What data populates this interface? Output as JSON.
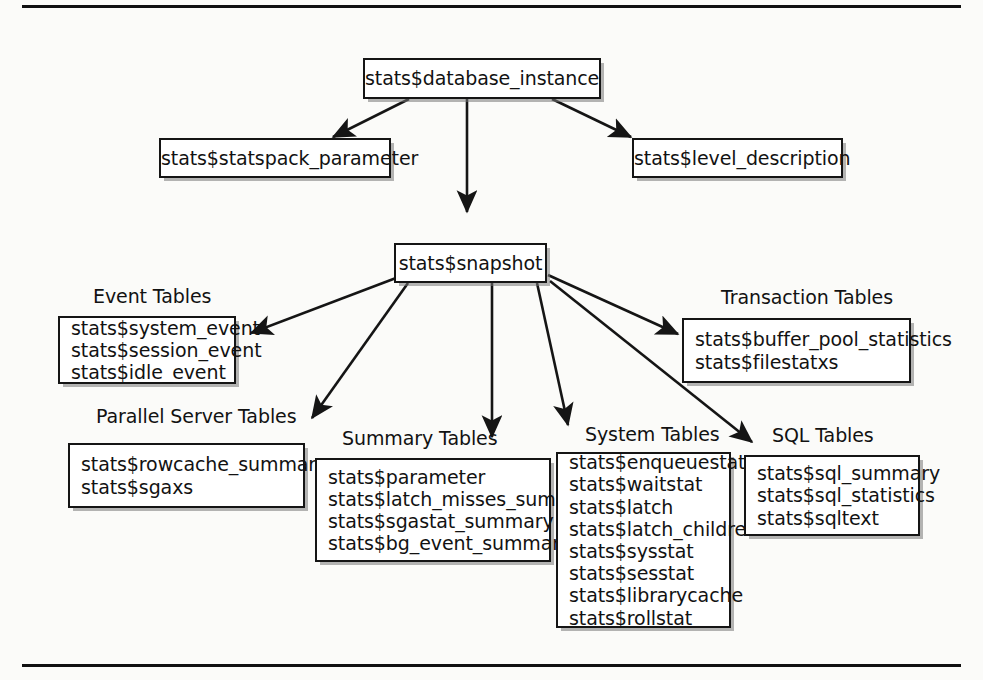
{
  "diagram": {
    "background_color": "#fbfbf9",
    "line_color": "#151515",
    "box_fill": "#ffffff",
    "rules": {
      "top": "horizontal-rule",
      "bottom": "horizontal-rule"
    }
  },
  "nodes": {
    "database_instance": {
      "label": "stats$database_instance"
    },
    "statspack_parameter": {
      "label": "stats$statspack_parameter"
    },
    "level_description": {
      "label": "stats$level_description"
    },
    "snapshot": {
      "label": "stats$snapshot"
    },
    "event_tables": {
      "group_label": "Event Tables",
      "lines": [
        "stats$system_event",
        "stats$session_event",
        "stats$idle_event"
      ]
    },
    "transaction_tables": {
      "group_label": "Transaction Tables",
      "lines": [
        "stats$buffer_pool_statistics",
        "stats$filestatxs"
      ]
    },
    "parallel_server_tables": {
      "group_label": "Parallel Server Tables",
      "lines": [
        "stats$rowcache_summary",
        "stats$sgaxs"
      ]
    },
    "summary_tables": {
      "group_label": "Summary Tables",
      "lines": [
        "stats$parameter",
        "stats$latch_misses_summary",
        "stats$sgastat_summary",
        "stats$bg_event_summary"
      ]
    },
    "system_tables": {
      "group_label": "System Tables",
      "lines": [
        "stats$enqueuestat",
        "stats$waitstat",
        "stats$latch",
        "stats$latch_children",
        "stats$sysstat",
        "stats$sesstat",
        "stats$librarycache",
        "stats$rollstat"
      ]
    },
    "sql_tables": {
      "group_label": "SQL Tables",
      "lines": [
        "stats$sql_summary",
        "stats$sql_statistics",
        "stats$sqltext"
      ]
    }
  },
  "edges": [
    {
      "from": "stats$database_instance",
      "to": "stats$statspack_parameter"
    },
    {
      "from": "stats$database_instance",
      "to": "stats$snapshot"
    },
    {
      "from": "stats$database_instance",
      "to": "stats$level_description"
    },
    {
      "from": "stats$snapshot",
      "to": "Event Tables"
    },
    {
      "from": "stats$snapshot",
      "to": "Parallel Server Tables"
    },
    {
      "from": "stats$snapshot",
      "to": "Summary Tables"
    },
    {
      "from": "stats$snapshot",
      "to": "System Tables"
    },
    {
      "from": "stats$snapshot",
      "to": "Transaction Tables"
    },
    {
      "from": "stats$snapshot",
      "to": "SQL Tables"
    }
  ]
}
